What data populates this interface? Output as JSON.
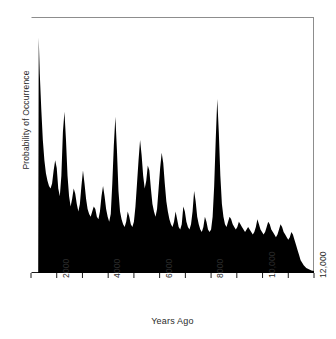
{
  "figure": {
    "width": 336,
    "height": 339,
    "background_color": "#ffffff",
    "frame_color": "#8d8d8d",
    "axis_color": "#1a1a1a"
  },
  "chart_data": {
    "type": "area",
    "title": "",
    "subtitle": "",
    "xlabel": "Years Ago",
    "ylabel": "Probability of Occurrence",
    "fill_color": "#000000",
    "grid": false,
    "legend": null,
    "xlim": [
      1000,
      12000
    ],
    "ylim": [
      0,
      1
    ],
    "xticks": [
      1000,
      2000,
      3000,
      4000,
      5000,
      6000,
      7000,
      8000,
      9000,
      10000,
      11000,
      12000
    ],
    "xtick_labels": [
      "",
      "2000",
      "",
      "4000",
      "",
      "6000",
      "",
      "8000",
      "",
      "10,000",
      "",
      "12,000"
    ],
    "xtick_labels_rotation": -90,
    "ytick_labels": [],
    "x_tick_interval": 1000,
    "series_name": "Probability of Occurrence",
    "x": [
      1280,
      1300,
      1340,
      1400,
      1460,
      1520,
      1580,
      1640,
      1700,
      1760,
      1820,
      1880,
      1940,
      2000,
      2060,
      2120,
      2180,
      2240,
      2300,
      2360,
      2420,
      2480,
      2540,
      2600,
      2660,
      2720,
      2780,
      2840,
      2900,
      2960,
      3020,
      3080,
      3140,
      3200,
      3260,
      3320,
      3380,
      3440,
      3500,
      3560,
      3620,
      3680,
      3740,
      3800,
      3860,
      3920,
      3980,
      4040,
      4100,
      4160,
      4220,
      4280,
      4340,
      4400,
      4460,
      4520,
      4580,
      4640,
      4700,
      4760,
      4820,
      4880,
      4940,
      5000,
      5060,
      5120,
      5180,
      5240,
      5300,
      5360,
      5420,
      5480,
      5540,
      5600,
      5660,
      5720,
      5780,
      5840,
      5900,
      5960,
      6020,
      6080,
      6140,
      6200,
      6260,
      6320,
      6380,
      6440,
      6500,
      6560,
      6620,
      6680,
      6740,
      6800,
      6860,
      6920,
      6980,
      7040,
      7100,
      7160,
      7220,
      7280,
      7340,
      7400,
      7460,
      7520,
      7580,
      7640,
      7700,
      7760,
      7820,
      7880,
      7940,
      8000,
      8060,
      8120,
      8180,
      8240,
      8300,
      8360,
      8420,
      8480,
      8540,
      8600,
      8660,
      8720,
      8780,
      8840,
      8900,
      8960,
      9020,
      9080,
      9140,
      9200,
      9260,
      9320,
      9380,
      9440,
      9500,
      9560,
      9620,
      9680,
      9740,
      9800,
      9860,
      9920,
      9980,
      10040,
      10100,
      10160,
      10220,
      10280,
      10340,
      10400,
      10460,
      10520,
      10580,
      10640,
      10700,
      10760,
      10820,
      10880,
      10940,
      11000,
      11060,
      11120,
      11180,
      11240,
      11300,
      11360,
      11420,
      11480,
      11540,
      11600,
      11700,
      11800,
      11900,
      12000
    ],
    "y": [
      0.0,
      0.92,
      0.78,
      0.64,
      0.52,
      0.44,
      0.39,
      0.36,
      0.34,
      0.33,
      0.35,
      0.4,
      0.44,
      0.41,
      0.33,
      0.3,
      0.38,
      0.55,
      0.63,
      0.52,
      0.38,
      0.3,
      0.26,
      0.29,
      0.33,
      0.31,
      0.27,
      0.24,
      0.27,
      0.34,
      0.4,
      0.35,
      0.29,
      0.25,
      0.23,
      0.22,
      0.24,
      0.26,
      0.25,
      0.22,
      0.21,
      0.24,
      0.3,
      0.34,
      0.3,
      0.25,
      0.22,
      0.2,
      0.23,
      0.35,
      0.5,
      0.61,
      0.48,
      0.32,
      0.24,
      0.21,
      0.19,
      0.18,
      0.2,
      0.24,
      0.22,
      0.19,
      0.18,
      0.2,
      0.26,
      0.35,
      0.44,
      0.52,
      0.46,
      0.38,
      0.33,
      0.36,
      0.42,
      0.4,
      0.33,
      0.27,
      0.24,
      0.22,
      0.25,
      0.33,
      0.41,
      0.47,
      0.43,
      0.35,
      0.28,
      0.24,
      0.21,
      0.19,
      0.18,
      0.2,
      0.24,
      0.21,
      0.18,
      0.17,
      0.19,
      0.26,
      0.24,
      0.2,
      0.18,
      0.17,
      0.19,
      0.24,
      0.32,
      0.28,
      0.22,
      0.19,
      0.17,
      0.16,
      0.18,
      0.22,
      0.2,
      0.17,
      0.16,
      0.17,
      0.22,
      0.34,
      0.52,
      0.68,
      0.55,
      0.38,
      0.27,
      0.22,
      0.19,
      0.18,
      0.2,
      0.22,
      0.21,
      0.19,
      0.18,
      0.17,
      0.18,
      0.2,
      0.19,
      0.18,
      0.17,
      0.16,
      0.17,
      0.18,
      0.17,
      0.16,
      0.15,
      0.16,
      0.18,
      0.21,
      0.19,
      0.17,
      0.16,
      0.15,
      0.16,
      0.18,
      0.2,
      0.19,
      0.17,
      0.16,
      0.15,
      0.14,
      0.15,
      0.17,
      0.19,
      0.18,
      0.16,
      0.15,
      0.14,
      0.13,
      0.14,
      0.16,
      0.15,
      0.13,
      0.11,
      0.09,
      0.07,
      0.05,
      0.04,
      0.03,
      0.02,
      0.015,
      0.01,
      0.008
    ],
    "peaks": [
      {
        "x": 1300,
        "y": 0.92,
        "note": "dominant peak, near top of axis"
      },
      {
        "x": 2300,
        "y": 0.63
      },
      {
        "x": 3620,
        "y": 0.61
      },
      {
        "x": 4340,
        "y": 0.52
      },
      {
        "x": 5000,
        "y": 0.47
      },
      {
        "x": 6020,
        "y": 0.72,
        "note": "very narrow spike"
      },
      {
        "x": 6380,
        "y": 0.43
      },
      {
        "x": 7220,
        "y": 0.52
      },
      {
        "x": 8180,
        "y": 0.52
      },
      {
        "x": 8900,
        "y": 0.4
      },
      {
        "x": 9620,
        "y": 0.46
      },
      {
        "x": 10220,
        "y": 0.55
      },
      {
        "x": 10520,
        "y": 0.62,
        "note": "broad late cluster"
      },
      {
        "x": 11000,
        "y": 0.44
      }
    ]
  }
}
